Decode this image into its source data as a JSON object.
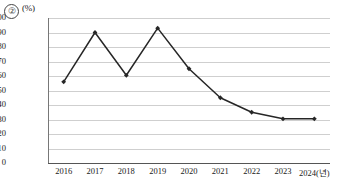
{
  "figure": {
    "corner_mark": "②",
    "unit_label": "(%)"
  },
  "chart_data": {
    "type": "line",
    "title": "",
    "subtitle": "",
    "xlabel": "",
    "ylabel": "",
    "unit": "(%)",
    "categories": [
      "2016",
      "2017",
      "2018",
      "2019",
      "2020",
      "2021",
      "2022",
      "2023",
      "2024(년)"
    ],
    "x_values": [
      2016,
      2017,
      2018,
      2019,
      2020,
      2021,
      2022,
      2023,
      2024
    ],
    "values": [
      56,
      90,
      60.5,
      93,
      65,
      45,
      35,
      30.5,
      30.5
    ],
    "series": [
      {
        "name": "",
        "values": [
          56,
          90,
          60.5,
          93,
          65,
          45,
          35,
          30.5,
          30.5
        ],
        "color": "#262626",
        "marker": "diamond"
      }
    ],
    "ylim": [
      0,
      100
    ],
    "y_ticks": [
      100,
      90,
      80,
      70,
      60,
      50,
      40,
      30,
      20,
      10,
      0
    ],
    "y_tick_labels": [
      "100",
      "90",
      "80",
      "70",
      "60",
      "50",
      "40",
      "30",
      "20",
      "10",
      "0"
    ],
    "grid": true,
    "grid_color": "#cfcfcf",
    "legend": false,
    "legend_position": "none",
    "annotations": []
  }
}
